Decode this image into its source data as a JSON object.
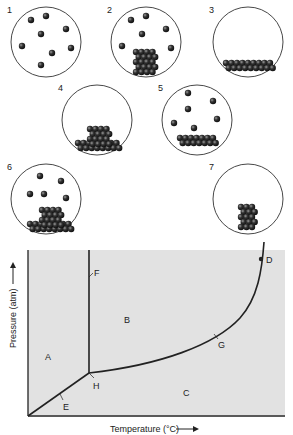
{
  "containers": [
    {
      "number": "1",
      "cx": 46,
      "cy": 42,
      "r": 35,
      "gas": [
        [
          31,
          20
        ],
        [
          46,
          16
        ],
        [
          66,
          29
        ],
        [
          41,
          34
        ],
        [
          22,
          46
        ],
        [
          52,
          53
        ],
        [
          71,
          48
        ],
        [
          41,
          65
        ]
      ],
      "solid": []
    },
    {
      "number": "2",
      "cx": 146,
      "cy": 42,
      "r": 35,
      "gas": [
        [
          131,
          20
        ],
        [
          146,
          16
        ],
        [
          166,
          29
        ],
        [
          142,
          34
        ],
        [
          122,
          46
        ],
        [
          171,
          48
        ]
      ],
      "solid_block": {
        "x": 136,
        "y": 52,
        "cols": 4,
        "rows": 5
      }
    },
    {
      "number": "3",
      "cx": 248,
      "cy": 42,
      "r": 35,
      "gas": [],
      "solid_layer": {
        "x": 226,
        "y": 63,
        "cols": 9,
        "rows": 2
      }
    },
    {
      "number": "4",
      "cx": 97,
      "cy": 120,
      "r": 35,
      "gas": [],
      "solid_block": {
        "x": 90,
        "y": 129,
        "cols": 4,
        "rows": 4
      },
      "solid_layer": {
        "x": 78,
        "y": 143,
        "cols": 8,
        "rows": 2
      }
    },
    {
      "number": "5",
      "cx": 197,
      "cy": 120,
      "r": 35,
      "gas": [
        [
          188,
          93
        ],
        [
          213,
          101
        ],
        [
          188,
          109
        ],
        [
          217,
          119
        ],
        [
          174,
          123
        ],
        [
          194,
          128
        ]
      ],
      "solid_layer": {
        "x": 180,
        "y": 138,
        "cols": 7,
        "rows": 2
      }
    },
    {
      "number": "6",
      "cx": 46,
      "cy": 199,
      "r": 35,
      "gas": [
        [
          40,
          176
        ],
        [
          61,
          181
        ],
        [
          30,
          194
        ],
        [
          44,
          194
        ],
        [
          66,
          198
        ]
      ],
      "solid_block": {
        "x": 42,
        "y": 210,
        "cols": 4,
        "rows": 4
      },
      "solid_layer": {
        "x": 30,
        "y": 224,
        "cols": 8,
        "rows": 2
      }
    },
    {
      "number": "7",
      "cx": 248,
      "cy": 199,
      "r": 35,
      "gas": [],
      "solid_block": {
        "x": 241,
        "y": 207,
        "cols": 3,
        "rows": 5
      }
    }
  ],
  "phase_diagram": {
    "region_labels": {
      "A": "A",
      "B": "B",
      "C": "C"
    },
    "point_labels": {
      "D": "D",
      "E": "E",
      "F": "F",
      "G": "G",
      "H": "H"
    },
    "x_axis_label": "Temperature (°C)",
    "y_axis_label": "Pressure (atm)",
    "background_color": "#e2e2e2",
    "line_color": "#222222"
  }
}
